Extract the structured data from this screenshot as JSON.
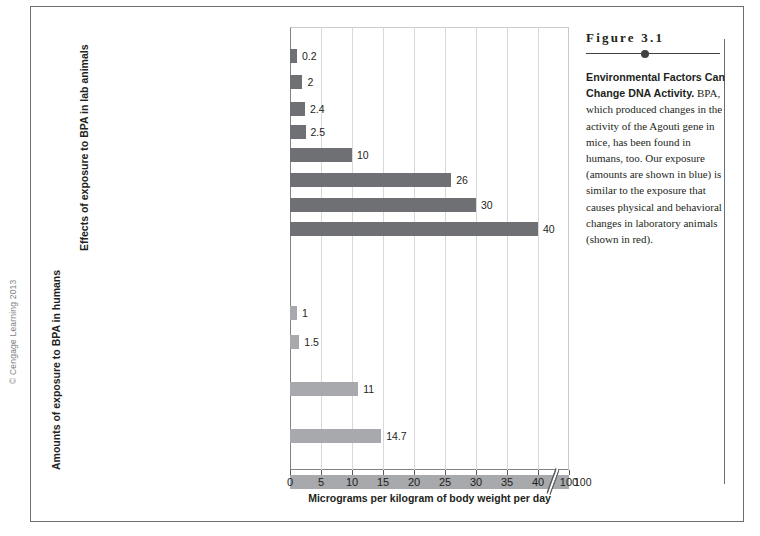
{
  "figure": {
    "number": "Figure 3.1",
    "lead": "Environmental Factors Can Change DNA Activity.",
    "body": " BPA, which produced changes in the activity of the Agouti gene in mice, has been found in humans, too. Our exposure (amounts are shown in blue) is similar to the exposure that causes physical and behavioral changes in laboratory animals (shown in red)."
  },
  "copyright": "© Cengage Learning 2013",
  "sections": {
    "animals_title": "Effects of exposure to BPA in lab animals",
    "humans_title": "Amounts of exposure to BPA in humans"
  },
  "chart_data": {
    "type": "bar",
    "orientation": "horizontal",
    "title": "Environmental Factors Can Change DNA Activity",
    "xlabel": "Micrograms per kilogram of body weight per day",
    "ylabel": "",
    "xlim": [
      0,
      45
    ],
    "grid": true,
    "axis_break": {
      "after": 40,
      "resumes_at": 100,
      "label_left": "40",
      "label_right": "100"
    },
    "xticks": [
      0,
      5,
      10,
      15,
      20,
      25,
      30,
      35,
      40,
      100
    ],
    "xtick_labels": [
      "0",
      "5",
      "10",
      "15",
      "20",
      "25",
      "30",
      "35",
      "40",
      "100"
    ],
    "legend": [
      {
        "name": "Effects of exposure to BPA in lab animals",
        "color_described": "red",
        "color_rendered": "#6f7073"
      },
      {
        "name": "Amounts of exposure to BPA in humans",
        "color_described": "blue",
        "color_rendered": "#a7a9ac"
      }
    ],
    "series": [
      {
        "name": "Effects of exposure to BPA in lab animals",
        "group": "animals",
        "color": "#6f7073",
        "categories": [
          "Decrease in male sperm production",
          "Increase in prostate size; increase in aggressive behavior",
          "Early onset of sexual maturity in females",
          "Altered immune function",
          "Decrease in maternal behavior",
          "Changes in the brain",
          "Hyperactivity",
          "Altered play and sociosexual behaviors"
        ],
        "values": [
          0.2,
          2,
          2.4,
          2.5,
          10,
          26,
          30,
          40
        ],
        "value_labels": [
          "0.2",
          "2",
          "2.4",
          "2.5",
          "10",
          "26",
          "30",
          "40"
        ]
      },
      {
        "name": "Amounts of exposure to BPA in humans",
        "group": "humans",
        "color": "#a7a9ac",
        "categories": [
          "Estimated exposure of a breast-fed human baby from birth to 6 months (an average liter of breast milk contains 1.3 micrograms of BPA)",
          "Estimated adult exposure",
          "Estimated exposure of a baby from birth to 6 months fed canned formula from a polycarbonate bottle",
          "Estimated exposure of a child up to 6 years old from eating canned food and using polycarbonate tableware",
          "Occupational exposure for people who work with BPA"
        ],
        "values": [
          1,
          1.5,
          11,
          14.7,
          100
        ],
        "value_labels": [
          "1",
          "1.5",
          "11",
          "14.7",
          "100"
        ]
      }
    ],
    "bars": [
      {
        "label_lines": [
          "Decrease in male sperm production"
        ],
        "value": 0.2,
        "value_label": "0.2",
        "group": "animals"
      },
      {
        "label_lines": [
          "Increase in prostate size; increase in",
          "aggressive behavior"
        ],
        "value": 2,
        "value_label": "2",
        "group": "animals"
      },
      {
        "label_lines": [
          "Early onset of sexual maturity in females"
        ],
        "value": 2.4,
        "value_label": "2.4",
        "group": "animals"
      },
      {
        "label_lines": [
          "Altered immune function"
        ],
        "value": 2.5,
        "value_label": "2.5",
        "group": "animals"
      },
      {
        "label_lines": [
          "Decrease in maternal behavior"
        ],
        "value": 10,
        "value_label": "10",
        "group": "animals"
      },
      {
        "label_lines": [
          "Changes in the brain"
        ],
        "value": 26,
        "value_label": "26",
        "group": "animals"
      },
      {
        "label_lines": [
          "Hyperactivity"
        ],
        "value": 30,
        "value_label": "30",
        "group": "animals"
      },
      {
        "label_lines": [
          "Altered play and sociosexual behaviors"
        ],
        "value": 40,
        "value_label": "40",
        "group": "animals"
      },
      {
        "label_lines": [
          "Estimated exposure of a breast-fed human baby",
          "from birth to 6 months (an average liter of breast",
          "milk contains 1.3 micrograms of BPA)"
        ],
        "value": 1,
        "value_label": "1",
        "group": "humans"
      },
      {
        "label_lines": [
          "Estimated adult exposure"
        ],
        "value": 1.5,
        "value_label": "1.5",
        "group": "humans"
      },
      {
        "label_lines": [
          "Estimated exposure of a baby from birth",
          "to 6 months fed canned formula",
          "from a polycarbonate bottle"
        ],
        "value": 11,
        "value_label": "11",
        "group": "humans"
      },
      {
        "label_lines": [
          "Estimated exposure of a child up to 6 years old",
          "from eating canned food and using",
          "polycarbonate tableware"
        ],
        "value": 14.7,
        "value_label": "14.7",
        "group": "humans"
      },
      {
        "label_lines": [
          "Occupational exposure for people",
          "who work with BPA"
        ],
        "value": 100,
        "value_label": "100",
        "group": "humans"
      }
    ]
  }
}
